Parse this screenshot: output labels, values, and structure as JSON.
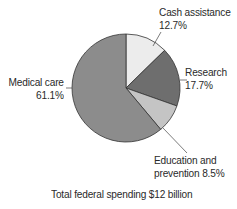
{
  "chart_data": {
    "type": "pie",
    "title": "",
    "caption": "Total federal spending $12 billion",
    "slices": [
      {
        "label": "Cash assistance",
        "value": 12.7,
        "display": "12.7%",
        "color": "#ececec"
      },
      {
        "label": "Research",
        "value": 17.7,
        "display": "17.7%",
        "color": "#6e6e6e"
      },
      {
        "label": "Education and prevention",
        "value": 8.5,
        "display": "8.5%",
        "color": "#c4c4c4"
      },
      {
        "label": "Medical care",
        "value": 61.1,
        "display": "61.1%",
        "color": "#8c8c8c"
      }
    ],
    "start_angle": "12 o'clock",
    "direction": "clockwise",
    "legend": "none (direct labels with leader lines)"
  },
  "labels": {
    "cash_line1": "Cash assistance",
    "cash_line2": "12.7%",
    "research_line1": "Research",
    "research_line2": "17.7%",
    "education_line1": "Education and",
    "education_line2": "prevention 8.5%",
    "medical_line1": "Medical care",
    "medical_line2": "61.1%"
  },
  "caption": "Total federal spending $12 billion"
}
